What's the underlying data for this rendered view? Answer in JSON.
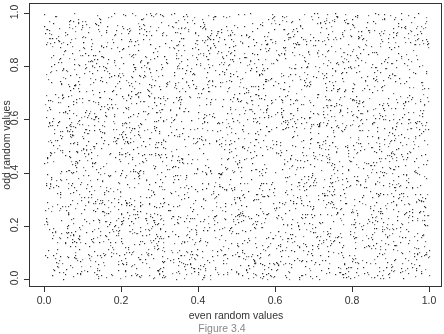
{
  "chart_data": {
    "type": "scatter",
    "title": "",
    "xlabel": "even random values",
    "ylabel": "odd random values",
    "xlim": [
      0.0,
      1.0
    ],
    "ylim": [
      0.0,
      1.0
    ],
    "x_ticks": [
      "0.0",
      "0.2",
      "0.4",
      "0.6",
      "0.8",
      "1.0"
    ],
    "y_ticks": [
      "0.0",
      "0.2",
      "0.4",
      "0.6",
      "0.8",
      "1.0"
    ],
    "grid": false,
    "legend": null,
    "series": [
      {
        "name": "random pairs",
        "distribution": "uniform(0,1) x uniform(0,1)",
        "approx_count": 4000,
        "seed": 12345,
        "marker": "dot",
        "color": "#222222"
      }
    ],
    "caption": "Figure 3.4"
  }
}
